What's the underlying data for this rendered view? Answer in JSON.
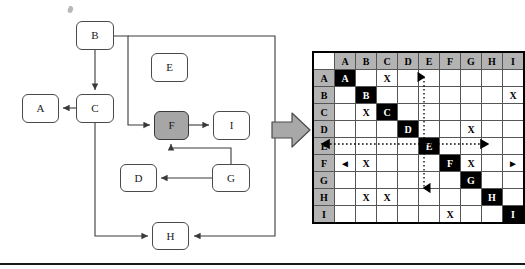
{
  "figure": {
    "accent_shaded": "#a6a6a6",
    "diag_color": "#000000",
    "header_color": "#b3b3b3"
  },
  "flowchart": {
    "nodes": [
      {
        "id": "A",
        "label": "A",
        "x": 22,
        "y": 94,
        "w": 37,
        "h": 29,
        "shaded": false
      },
      {
        "id": "B",
        "label": "B",
        "x": 76,
        "y": 21,
        "w": 38,
        "h": 29,
        "shaded": false
      },
      {
        "id": "C",
        "label": "C",
        "x": 76,
        "y": 94,
        "w": 38,
        "h": 29,
        "shaded": false
      },
      {
        "id": "D",
        "label": "D",
        "x": 120,
        "y": 164,
        "w": 37,
        "h": 28,
        "shaded": false
      },
      {
        "id": "E",
        "label": "E",
        "x": 151,
        "y": 53,
        "w": 37,
        "h": 29,
        "shaded": false
      },
      {
        "id": "F",
        "label": "F",
        "x": 154,
        "y": 111,
        "w": 35,
        "h": 29,
        "shaded": true
      },
      {
        "id": "G",
        "label": "G",
        "x": 212,
        "y": 164,
        "w": 38,
        "h": 28,
        "shaded": false
      },
      {
        "id": "H",
        "label": "H",
        "x": 152,
        "y": 222,
        "w": 37,
        "h": 28,
        "shaded": false
      },
      {
        "id": "I",
        "label": "I",
        "x": 213,
        "y": 111,
        "w": 37,
        "h": 29,
        "shaded": false
      }
    ],
    "edges": [
      {
        "from": "B",
        "to": "C",
        "label": "B-to-C"
      },
      {
        "from": "C",
        "to": "A",
        "label": "C-to-A"
      },
      {
        "from": "B",
        "to": "F",
        "label": "B-to-F"
      },
      {
        "from": "F",
        "to": "I",
        "label": "F-to-I"
      },
      {
        "from": "G",
        "to": "F",
        "label": "G-to-F"
      },
      {
        "from": "G",
        "to": "D",
        "label": "G-to-D"
      },
      {
        "from": "C",
        "to": "H",
        "label": "C-to-H"
      },
      {
        "from": "B",
        "to": "H",
        "label": "B-to-H"
      }
    ]
  },
  "transition": {
    "arrow_label": "maps-to"
  },
  "matrix": {
    "corner_label": "",
    "columns": [
      "A",
      "B",
      "C",
      "D",
      "E",
      "F",
      "G",
      "H",
      "I"
    ],
    "rows": [
      "A",
      "B",
      "C",
      "D",
      "E",
      "F",
      "G",
      "H",
      "I"
    ],
    "cells": [
      [
        "A",
        "",
        "X",
        "",
        "",
        "",
        "",
        "",
        ""
      ],
      [
        "",
        "B",
        "",
        "",
        "",
        "",
        "",
        "",
        "X"
      ],
      [
        "",
        "X",
        "C",
        "",
        "",
        "",
        "",
        "",
        ""
      ],
      [
        "",
        "",
        "",
        "D",
        "",
        "",
        "X",
        "",
        ""
      ],
      [
        "",
        "",
        "",
        "",
        "E",
        "",
        "",
        "",
        ""
      ],
      [
        "◄",
        "X",
        "",
        "",
        "",
        "F",
        "X",
        "",
        "►"
      ],
      [
        "",
        "",
        "",
        "",
        "",
        "",
        "G",
        "",
        ""
      ],
      [
        "",
        "X",
        "X",
        "",
        "",
        "",
        "",
        "H",
        ""
      ],
      [
        "",
        "",
        "",
        "",
        "",
        "X",
        "",
        "",
        "I"
      ]
    ],
    "diagonal_cells": [
      "A",
      "B",
      "C",
      "D",
      "E",
      "F",
      "G",
      "H",
      "I"
    ],
    "highlight": {
      "row": "F",
      "column": "F",
      "style": "dotted-crosshair",
      "row_arrow_left": "◄",
      "row_arrow_right": "►",
      "col_arrow_up": "▲",
      "col_arrow_down": "▼"
    }
  }
}
